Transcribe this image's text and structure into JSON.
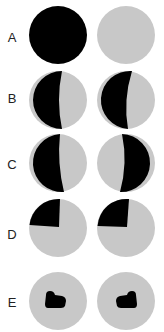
{
  "colors": {
    "dark": "#000000",
    "light": "#c8c8c8",
    "background": "#ffffff"
  },
  "rows": [
    {
      "label": "A",
      "left": "fully-dark",
      "right": "fully-light"
    },
    {
      "label": "B",
      "left": "left-half-dark",
      "right": "left-half-dark"
    },
    {
      "label": "C",
      "left": "left-half-dark",
      "right": "right-half-dark"
    },
    {
      "label": "D",
      "left": "upper-left-quadrant-dark",
      "right": "upper-left-quadrant-dark"
    },
    {
      "label": "E",
      "left": "central-dark-blob",
      "right": "central-dark-blob"
    }
  ]
}
